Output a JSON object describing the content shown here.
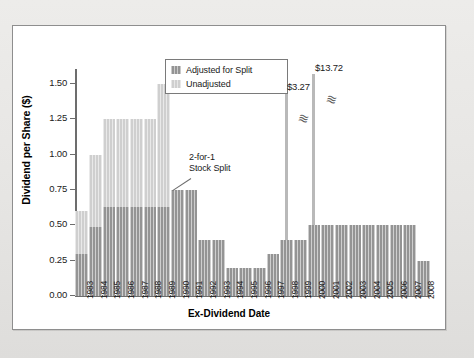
{
  "chart_data": {
    "type": "bar",
    "title": "",
    "xlabel": "Ex-Dividend Date",
    "ylabel": "Dividend per Share ($)",
    "ylim": [
      0.0,
      1.6
    ],
    "yticks": [
      "0.00",
      "0.25",
      "0.50",
      "0.75",
      "1.00",
      "1.25",
      "1.50"
    ],
    "ytick_values": [
      0.0,
      0.25,
      0.5,
      0.75,
      1.0,
      1.25,
      1.5
    ],
    "grid": false,
    "legend_position": "top-center",
    "categories": [
      "1983",
      "1984",
      "1985",
      "1986",
      "1987",
      "1988",
      "1989",
      "1990",
      "1991",
      "1992",
      "1993",
      "1994",
      "1995",
      "1996",
      "1997",
      "1998",
      "1999",
      "2000",
      "2001",
      "2002",
      "2003",
      "2004",
      "2005",
      "2006",
      "2007",
      "2008"
    ],
    "series": [
      {
        "name": "Unadjusted",
        "color": "#cfcfcf",
        "values": [
          0.6,
          1.0,
          1.25,
          1.25,
          1.25,
          1.25,
          1.5,
          null,
          null,
          null,
          null,
          null,
          null,
          null,
          null,
          null,
          null,
          null,
          null,
          null,
          null,
          null,
          null,
          null,
          null,
          null
        ]
      },
      {
        "name": "Adjusted for Split",
        "color": "#949494",
        "values": [
          0.3,
          0.49,
          0.63,
          0.63,
          0.63,
          0.63,
          0.63,
          0.75,
          0.75,
          0.4,
          0.4,
          0.2,
          0.2,
          0.2,
          0.3,
          0.4,
          0.4,
          0.5,
          0.5,
          0.5,
          0.5,
          0.5,
          0.5,
          0.5,
          0.5,
          0.25
        ]
      }
    ],
    "special_bars": [
      {
        "category": "1998",
        "value": 3.27,
        "label": "$3.27",
        "broken_axis": true,
        "color": "#b9b9b9"
      },
      {
        "category": "2000",
        "value": 13.72,
        "label": "$13.72",
        "broken_axis": true,
        "color": "#b9b9b9"
      }
    ],
    "annotations": [
      {
        "text": "2-for-1\nStock Split",
        "points_to": "1989",
        "type": "leader-line"
      },
      {
        "text": "$3.27",
        "points_to": "1998",
        "type": "value-label"
      },
      {
        "text": "$13.72",
        "points_to": "2000",
        "type": "value-label"
      }
    ]
  },
  "legend": {
    "items": [
      {
        "label": "Adjusted for Split",
        "swatch": "adj"
      },
      {
        "label": "Unadjusted",
        "swatch": "unadj"
      }
    ]
  },
  "annotations": {
    "split_note_line1": "2-for-1",
    "split_note_line2": "Stock Split",
    "spike_1998_label": "$3.27",
    "spike_2000_label": "$13.72",
    "break_glyph": "≈"
  },
  "axes": {
    "y_title": "Dividend per Share ($)",
    "x_title": "Ex-Dividend Date"
  },
  "colors": {
    "adjusted": "#949494",
    "unadjusted": "#cfcfcf",
    "spike": "#b9b9b9",
    "axis": "#6d6d6d",
    "panel_bg": "#ffffff",
    "page_bg": "#e9e9e7"
  }
}
